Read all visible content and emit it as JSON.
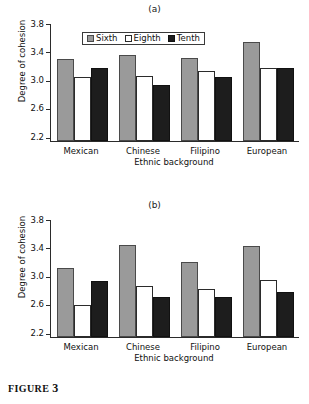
{
  "figure": {
    "caption_label": "FIGURE",
    "caption_number": "3"
  },
  "panels": [
    {
      "label": "(a)"
    },
    {
      "label": "(b)"
    }
  ],
  "axis": {
    "ylabel": "Degree of cohesion",
    "xlabel": "Ethnic background",
    "yticks": [
      "3.8",
      "3.4",
      "3.0",
      "2.6",
      "2.2"
    ],
    "categories": [
      "Mexican",
      "Chinese",
      "Filipino",
      "European"
    ]
  },
  "legend": {
    "items": [
      {
        "label": "Sixth",
        "color": "#9a9a9a"
      },
      {
        "label": "Eighth",
        "color": "#ffffff"
      },
      {
        "label": "Tenth",
        "color": "#1d1d1d"
      }
    ]
  },
  "chart_data": [
    {
      "type": "bar",
      "title": "(a)",
      "xlabel": "Ethnic background",
      "ylabel": "Degree of cohesion",
      "ylim": [
        2.2,
        3.8
      ],
      "yticks": [
        2.2,
        2.6,
        3.0,
        3.4,
        3.8
      ],
      "grid": false,
      "legend_position": "top-center",
      "categories": [
        "Mexican",
        "Chinese",
        "Filipino",
        "European"
      ],
      "series": [
        {
          "name": "Sixth",
          "values": [
            3.32,
            3.38,
            3.34,
            3.55
          ]
        },
        {
          "name": "Eighth",
          "values": [
            3.08,
            3.09,
            3.16,
            3.2
          ]
        },
        {
          "name": "Tenth",
          "values": [
            3.2,
            2.97,
            3.07,
            3.2
          ]
        }
      ]
    },
    {
      "type": "bar",
      "title": "(b)",
      "xlabel": "Ethnic background",
      "ylabel": "Degree of cohesion",
      "ylim": [
        2.2,
        3.8
      ],
      "yticks": [
        2.2,
        2.6,
        3.0,
        3.4,
        3.8
      ],
      "grid": false,
      "legend_position": "none",
      "categories": [
        "Mexican",
        "Chinese",
        "Filipino",
        "European"
      ],
      "series": [
        {
          "name": "Sixth",
          "values": [
            3.14,
            3.46,
            3.22,
            3.45
          ]
        },
        {
          "name": "Eighth",
          "values": [
            2.64,
            2.9,
            2.86,
            2.98
          ]
        },
        {
          "name": "Tenth",
          "values": [
            2.97,
            2.75,
            2.75,
            2.81
          ]
        }
      ]
    }
  ]
}
